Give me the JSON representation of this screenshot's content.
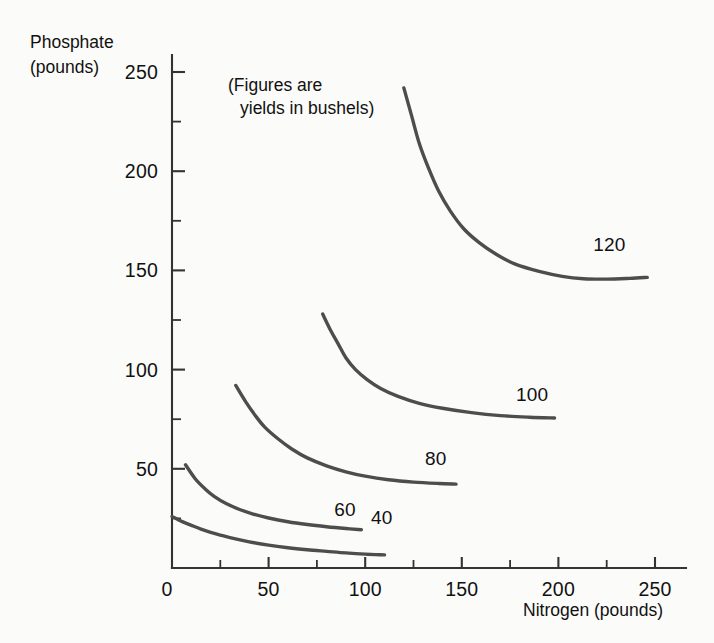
{
  "chart_data": {
    "type": "line",
    "title": "",
    "subtitle": "",
    "annotation_line1": "(Figures are",
    "annotation_line2": "yields in bushels)",
    "xlabel": "Nitrogen (pounds)",
    "ylabel_line1": "Phosphate",
    "ylabel_line2": "(pounds)",
    "xlim": [
      0,
      260
    ],
    "ylim": [
      0,
      262
    ],
    "xticks": [
      0,
      50,
      100,
      150,
      200,
      250
    ],
    "yticks": [
      0,
      50,
      100,
      150,
      200,
      250
    ],
    "xticks_minor": [
      25,
      75,
      125,
      175,
      225
    ],
    "yticks_minor": [
      25,
      75,
      125,
      175,
      225
    ],
    "xtick_labels": [
      "0",
      "50",
      "100",
      "150",
      "200",
      "250"
    ],
    "ytick_labels": [
      "0",
      "50",
      "100",
      "150",
      "200",
      "250"
    ],
    "grid": false,
    "legend": "none",
    "line_color": "#4d4d4d",
    "axis_color": "#333333",
    "background_color": "#fbfbf9",
    "series": [
      {
        "name": "40",
        "label": "40",
        "label_x": 103,
        "label_y": 22,
        "points": [
          [
            0,
            26
          ],
          [
            5,
            23.5
          ],
          [
            10,
            21.5
          ],
          [
            15,
            19.6
          ],
          [
            20,
            18.0
          ],
          [
            25,
            16.6
          ],
          [
            30,
            15.3
          ],
          [
            40,
            13.2
          ],
          [
            50,
            11.5
          ],
          [
            60,
            10.2
          ],
          [
            70,
            9.2
          ],
          [
            80,
            8.4
          ],
          [
            90,
            7.6
          ],
          [
            100,
            7.0
          ],
          [
            110,
            6.6
          ]
        ]
      },
      {
        "name": "60",
        "label": "60",
        "label_x": 84,
        "label_y": 26,
        "points": [
          [
            7,
            52
          ],
          [
            12,
            45
          ],
          [
            17,
            40
          ],
          [
            22,
            36
          ],
          [
            28,
            32.5
          ],
          [
            35,
            29.5
          ],
          [
            42,
            27.2
          ],
          [
            50,
            25.2
          ],
          [
            60,
            23.3
          ],
          [
            70,
            21.9
          ],
          [
            80,
            20.8
          ],
          [
            90,
            19.9
          ],
          [
            98,
            19.3
          ]
        ]
      },
      {
        "name": "80",
        "label": "80",
        "label_x": 131,
        "label_y": 52,
        "points": [
          [
            33,
            92
          ],
          [
            38,
            84
          ],
          [
            43,
            77
          ],
          [
            48,
            71
          ],
          [
            55,
            65
          ],
          [
            62,
            60
          ],
          [
            70,
            55.5
          ],
          [
            80,
            51.5
          ],
          [
            90,
            48.5
          ],
          [
            100,
            46.3
          ],
          [
            112,
            44.5
          ],
          [
            125,
            43.3
          ],
          [
            138,
            42.6
          ],
          [
            147,
            42.3
          ]
        ]
      },
      {
        "name": "100",
        "label": "100",
        "label_x": 178,
        "label_y": 84,
        "points": [
          [
            78,
            128
          ],
          [
            82,
            120
          ],
          [
            86,
            113
          ],
          [
            90,
            106
          ],
          [
            95,
            100
          ],
          [
            101,
            95
          ],
          [
            108,
            90.5
          ],
          [
            117,
            86.5
          ],
          [
            128,
            83
          ],
          [
            140,
            80.5
          ],
          [
            155,
            78.3
          ],
          [
            170,
            76.8
          ],
          [
            185,
            76.0
          ],
          [
            198,
            75.6
          ]
        ]
      },
      {
        "name": "120",
        "label": "120",
        "label_x": 218,
        "label_y": 160,
        "points": [
          [
            120,
            242
          ],
          [
            124,
            228
          ],
          [
            128,
            214
          ],
          [
            133,
            201
          ],
          [
            138,
            190
          ],
          [
            144,
            180
          ],
          [
            151,
            171
          ],
          [
            159,
            164
          ],
          [
            168,
            158
          ],
          [
            178,
            153
          ],
          [
            190,
            149.5
          ],
          [
            202,
            147
          ],
          [
            213,
            145.8
          ],
          [
            225,
            145.6
          ],
          [
            237,
            146
          ],
          [
            246,
            146.5
          ]
        ]
      }
    ]
  }
}
